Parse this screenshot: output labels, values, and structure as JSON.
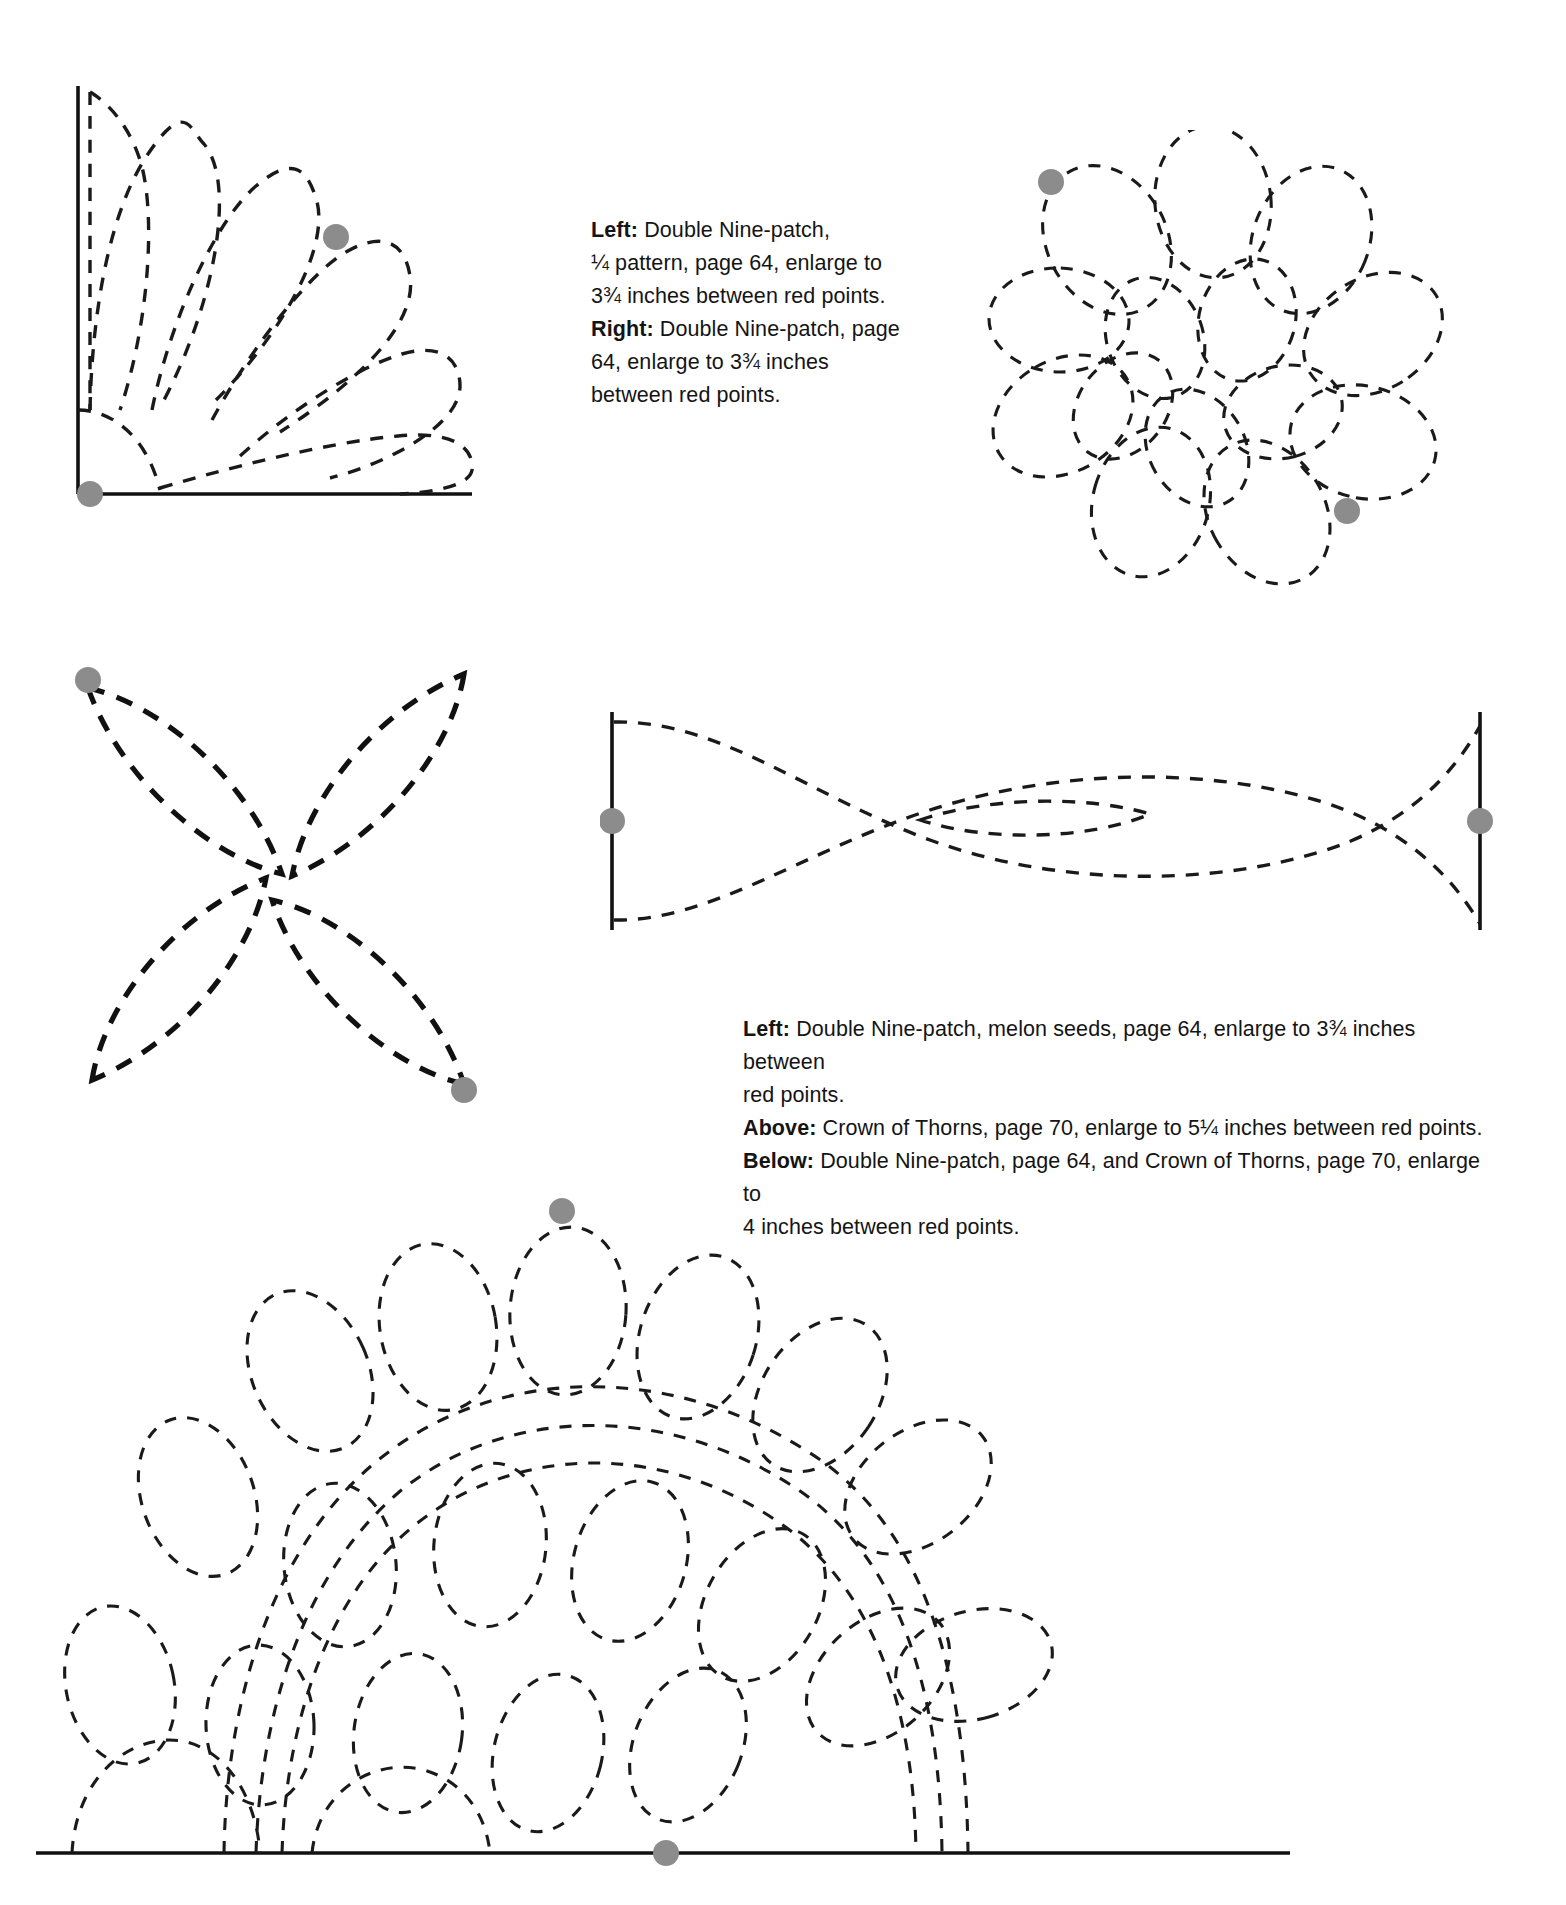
{
  "page": {
    "background_color": "#ffffff",
    "ink_color": "#1a1a1a",
    "marker_dot_color": "#8c8c8c"
  },
  "captions": {
    "top": {
      "lines": [
        {
          "lead": "Left:",
          "text": " Double Nine-patch,"
        },
        {
          "lead": "",
          "text": "¼ pattern, page 64, enlarge to"
        },
        {
          "lead": "",
          "text": "3¾ inches between red points."
        },
        {
          "lead": "Right:",
          "text": " Double Nine-patch, page"
        },
        {
          "lead": "",
          "text": "64, enlarge to 3¾ inches"
        },
        {
          "lead": "",
          "text": "between red points."
        }
      ]
    },
    "middle": {
      "lines": [
        {
          "lead": "Left:",
          "text": " Double Nine-patch, melon seeds, page 64, enlarge to 3¾ inches between"
        },
        {
          "lead": "",
          "text": "red points."
        },
        {
          "lead": "Above:",
          "text": " Crown of Thorns, page 70, enlarge to 5¼ inches between red points."
        },
        {
          "lead": "Below:",
          "text": " Double Nine-patch, page 64, and Crown of Thorns, page 70, enlarge to"
        },
        {
          "lead": "",
          "text": "4 inches between red points."
        }
      ]
    }
  },
  "figures": [
    {
      "id": "fan-quarter",
      "name": "Double Nine-patch quarter fan pattern",
      "position": "top-left",
      "marker_dots": 2,
      "pattern_reference": "Double Nine-patch, ¼ pattern, page 64",
      "enlarge_to": "3¾ inches between red points"
    },
    {
      "id": "full-flower",
      "name": "Double Nine-patch full rosette pattern",
      "position": "top-right",
      "marker_dots": 2,
      "pattern_reference": "Double Nine-patch, page 64",
      "enlarge_to": "3¾ inches between red points"
    },
    {
      "id": "melon-seeds",
      "name": "Double Nine-patch melon seeds four-petal pattern",
      "position": "middle-left",
      "marker_dots": 2,
      "pattern_reference": "Double Nine-patch, melon seeds, page 64",
      "enlarge_to": "3¾ inches between red points"
    },
    {
      "id": "crown-of-thorns",
      "name": "Crown of Thorns crossing-ribbon border pattern",
      "position": "middle-right",
      "marker_dots": 2,
      "pattern_reference": "Crown of Thorns, page 70",
      "enlarge_to": "5¼ inches between red points"
    },
    {
      "id": "combined-border",
      "name": "Double Nine-patch and Crown of Thorns combined border pattern",
      "position": "bottom",
      "marker_dots": 2,
      "pattern_reference": "Double Nine-patch, page 64, and Crown of Thorns, page 70",
      "enlarge_to": "4 inches between red points"
    }
  ]
}
